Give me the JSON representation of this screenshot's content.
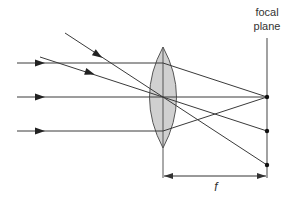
{
  "diagram": {
    "labels": {
      "focal_plane_line1": "focal",
      "focal_plane_line2": "plane",
      "focal_length": "f"
    },
    "colors": {
      "line": "#3a3a3a",
      "lens_fill": "#d0d0d0",
      "lens_stroke": "#555555",
      "background": "#ffffff"
    },
    "lens": {
      "center": [
        163,
        97
      ],
      "top": [
        163,
        47
      ],
      "bottom": [
        163,
        148
      ],
      "half_width": 19
    },
    "focal_plane_x": 267,
    "rays": [
      {
        "name": "parallel-axis-top",
        "points": [
          [
            17,
            63
          ],
          [
            163,
            63
          ],
          [
            267,
            97
          ]
        ]
      },
      {
        "name": "parallel-axis-center",
        "points": [
          [
            17,
            97
          ],
          [
            267,
            97
          ]
        ]
      },
      {
        "name": "parallel-axis-bottom",
        "points": [
          [
            17,
            131
          ],
          [
            163,
            131
          ],
          [
            267,
            97
          ]
        ]
      },
      {
        "name": "oblique-steep",
        "points": [
          [
            65,
            33
          ],
          [
            267,
            165
          ]
        ]
      },
      {
        "name": "oblique-shallow",
        "points": [
          [
            40,
            57
          ],
          [
            267,
            131
          ]
        ]
      }
    ],
    "focal_points": [
      {
        "name": "focal-point-axis",
        "x": 267,
        "y": 97
      },
      {
        "name": "focal-point-mid",
        "x": 267,
        "y": 131
      },
      {
        "name": "focal-point-low",
        "x": 267,
        "y": 165
      }
    ]
  }
}
